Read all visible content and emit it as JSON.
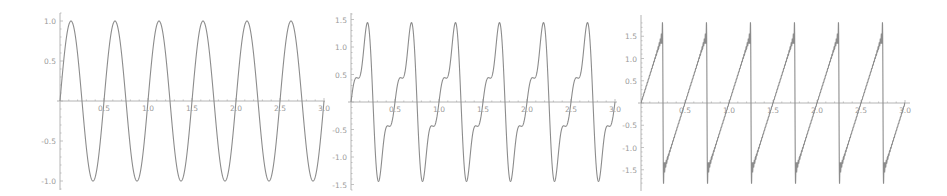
{
  "chart_data": [
    {
      "type": "line",
      "title": "",
      "xlabel": "",
      "ylabel": "",
      "description": "Sine wave, 6 cycles over [0, 3]",
      "function": "sin(4*pi*x)",
      "x_ticks": [
        "0.5",
        "1.0",
        "1.5",
        "2.0",
        "2.5",
        "3.0"
      ],
      "y_ticks": [
        "1.0",
        "0.5",
        "-0.5",
        "-1.0"
      ],
      "xlim": [
        0,
        3
      ],
      "ylim": [
        -1.1,
        1.1
      ],
      "series": [
        {
          "name": "f",
          "terms": 1,
          "peak": 1.0,
          "trough": -1.0,
          "period": 0.5
        }
      ],
      "layout": {
        "x0": 60,
        "x_end": 325,
        "y0": 101,
        "px_per_x": 88,
        "px_per_y": 80,
        "y_top": 13,
        "y_bot": 190
      }
    },
    {
      "type": "line",
      "title": "",
      "xlabel": "",
      "ylabel": "",
      "description": "Sawtooth Fourier partial sum, 3 terms, period 0.5",
      "function": "sum_{k=1..3} (-1)^(k+1) sin(4*pi*k*x)/k",
      "x_ticks": [
        "0.5",
        "1.0",
        "1.5",
        "2.0",
        "2.5",
        "3.0"
      ],
      "y_ticks": [
        "1.5",
        "1.0",
        "0.5",
        "-0.5",
        "-1.0",
        "-1.5"
      ],
      "xlim": [
        0,
        3
      ],
      "ylim": [
        -1.6,
        1.6
      ],
      "series": [
        {
          "name": "f",
          "terms": 3,
          "peak": 1.42,
          "trough": -1.42,
          "plateau": 0.42,
          "period": 0.5
        }
      ],
      "layout": {
        "x0": 351,
        "x_end": 617,
        "y0": 102,
        "px_per_x": 88,
        "px_per_y": 55,
        "y_top": 13,
        "y_bot": 190
      }
    },
    {
      "type": "line",
      "title": "",
      "xlabel": "",
      "ylabel": "",
      "description": "Sawtooth Fourier partial sum, many terms (Gibbs overshoot), period 0.5, jumps at 0.25 + 0.5k",
      "function": "sum_{k=1..N} (-1)^(k+1) sin(4*pi*k*x)/k",
      "x_ticks": [
        "0.5",
        "1.0",
        "1.5",
        "2.0",
        "2.5",
        "3.0"
      ],
      "y_ticks": [
        "1.5",
        "1.0",
        "0.5",
        "-0.5",
        "-1.0",
        "-1.5"
      ],
      "xlim": [
        0,
        3
      ],
      "ylim": [
        -1.85,
        1.85
      ],
      "series": [
        {
          "name": "f",
          "terms": 40,
          "peak": 1.75,
          "trough": -1.75,
          "period": 0.5
        }
      ],
      "layout": {
        "x0": 641,
        "x_end": 910,
        "y0": 103,
        "px_per_x": 88,
        "px_per_y": 44.5,
        "y_top": 15,
        "y_bot": 191
      }
    }
  ]
}
